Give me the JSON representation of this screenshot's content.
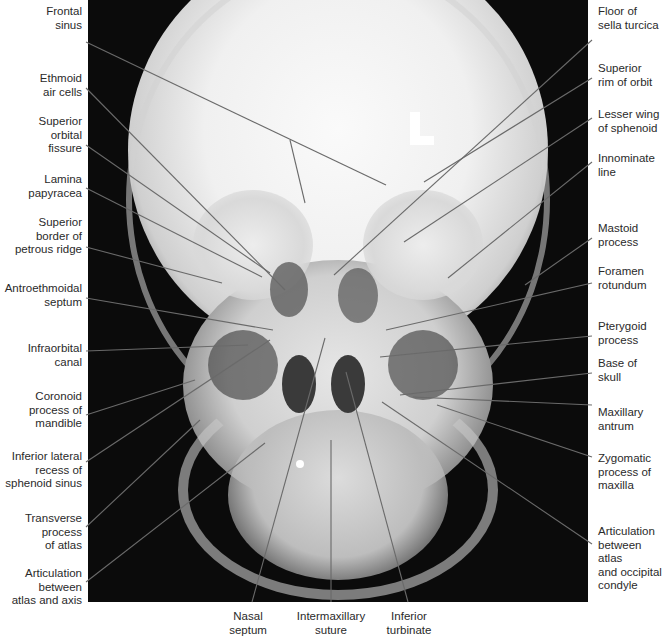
{
  "figure": {
    "colors": {
      "background": "#ffffff",
      "film": "#0b0b0b",
      "bone": "#e8e8e8",
      "leader": "#6a6a6a",
      "text": "#2a2a2a"
    }
  },
  "labels": {
    "left": [
      {
        "text": "Frontal\nsinus",
        "x": 82,
        "y": 5
      },
      {
        "text": "Ethmoid\nair cells",
        "x": 82,
        "y": 72
      },
      {
        "text": "Superior\norbital\nfissure",
        "x": 82,
        "y": 115
      },
      {
        "text": "Lamina\npapyracea",
        "x": 82,
        "y": 173
      },
      {
        "text": "Superior\nborder of\npetrous ridge",
        "x": 82,
        "y": 216
      },
      {
        "text": "Antroethmoidal\nseptum",
        "x": 82,
        "y": 282
      },
      {
        "text": "Infraorbital\ncanal",
        "x": 82,
        "y": 342
      },
      {
        "text": "Coronoid\nprocess of\nmandible",
        "x": 82,
        "y": 390
      },
      {
        "text": "Inferior lateral\nrecess of\nsphenoid sinus",
        "x": 82,
        "y": 450
      },
      {
        "text": "Transverse\nprocess\nof atlas",
        "x": 82,
        "y": 512
      },
      {
        "text": "Articulation\nbetween\natlas and axis",
        "x": 82,
        "y": 567
      }
    ],
    "right": [
      {
        "text": "Floor of\nsella turcica",
        "x": 598,
        "y": 5
      },
      {
        "text": "Superior\nrim of orbit",
        "x": 598,
        "y": 62
      },
      {
        "text": "Lesser wing\nof sphenoid",
        "x": 598,
        "y": 108
      },
      {
        "text": "Innominate\nline",
        "x": 598,
        "y": 152
      },
      {
        "text": "Mastoid\nprocess",
        "x": 598,
        "y": 222
      },
      {
        "text": "Foramen\nrotundum",
        "x": 598,
        "y": 265
      },
      {
        "text": "Pterygoid\nprocess",
        "x": 598,
        "y": 320
      },
      {
        "text": "Base of\nskull",
        "x": 598,
        "y": 357
      },
      {
        "text": "Maxillary\nantrum",
        "x": 598,
        "y": 406
      },
      {
        "text": "Zygomatic\nprocess of\nmaxilla",
        "x": 598,
        "y": 452
      },
      {
        "text": "Articulation\nbetween atlas\nand occipital\ncondyle",
        "x": 598,
        "y": 525
      }
    ],
    "bottom": [
      {
        "text": "Nasal\nseptum",
        "x": 248,
        "y": 610
      },
      {
        "text": "Intermaxillary\nsuture",
        "x": 331,
        "y": 610
      },
      {
        "text": "Inferior\nturbinate",
        "x": 408,
        "y": 610
      }
    ]
  }
}
